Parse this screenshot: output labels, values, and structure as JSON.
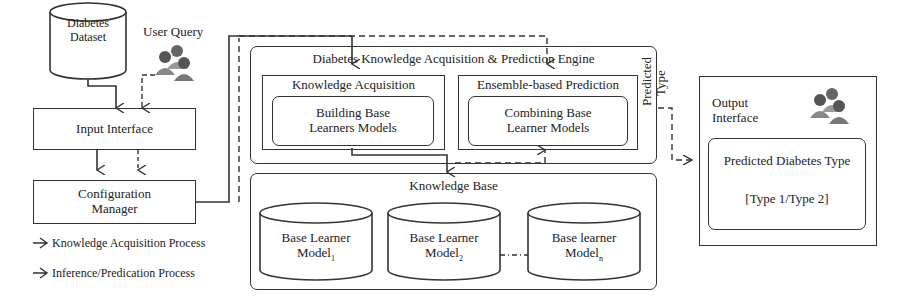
{
  "diagram": {
    "dataset": {
      "line1": "Diabetes",
      "line2": "Dataset"
    },
    "user_query_label": "User Query",
    "input_interface": "Input Interface",
    "config_manager": {
      "line1": "Configuration",
      "line2": "Manager"
    },
    "legend": [
      {
        "label": "Knowledge Acquisition Process",
        "style": "solid"
      },
      {
        "label": "Inference/Predication Process",
        "style": "dashed"
      }
    ],
    "engine": {
      "title": "Diabetes Knowledge Acquisition & Prediction Engine",
      "knowledge_acquisition": {
        "title": "Knowledge Acquisition",
        "inner": {
          "line1": "Building Base",
          "line2": "Learners Models"
        }
      },
      "ensemble_prediction": {
        "title": "Ensemble-based Prediction",
        "inner": {
          "line1": "Combining Base",
          "line2": "Learner Models"
        }
      }
    },
    "knowledge_base": {
      "title": "Knowledge Base",
      "models": [
        {
          "line1": "Base Learner",
          "line2": "Model",
          "sub": "1"
        },
        {
          "line1": "Base Learner",
          "line2": "Model",
          "sub": "2"
        },
        {
          "line1": "Base learner",
          "line2": "Model",
          "sub": "n"
        }
      ]
    },
    "predicted_type_label": {
      "line1": "Predicted",
      "line2": "Type"
    },
    "output": {
      "title_line1": "Output",
      "title_line2": "Interface",
      "inner_title": "Predicted Diabetes Type",
      "inner_value": "[Type 1/Type 2]"
    }
  }
}
